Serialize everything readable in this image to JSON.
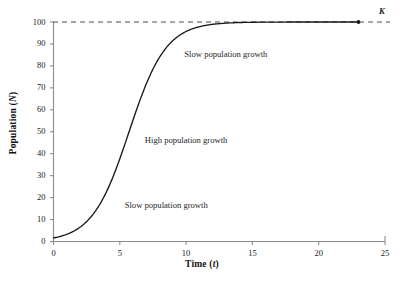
{
  "chart_data": {
    "type": "line",
    "title": "",
    "xlabel": "Time (t)",
    "ylabel": "Population (N)",
    "xlabel_text": "Time",
    "xlabel_symbol": "t",
    "ylabel_text": "Population",
    "ylabel_symbol": "N",
    "xlim": [
      0,
      25
    ],
    "ylim": [
      0,
      100
    ],
    "xticks": [
      0,
      5,
      10,
      15,
      20,
      25
    ],
    "yticks": [
      0,
      10,
      20,
      30,
      40,
      50,
      60,
      70,
      80,
      90,
      100
    ],
    "xtick_labels": [
      "0",
      "5",
      "10",
      "15",
      "20",
      "25"
    ],
    "ytick_labels": [
      "0",
      "10",
      "20",
      "30",
      "40",
      "50",
      "60",
      "70",
      "80",
      "90",
      "100"
    ],
    "grid": false,
    "legend": false,
    "series": [
      {
        "name": "Logistic population growth",
        "style": "solid",
        "color": "#1a1a1a",
        "end_marker": "dot",
        "model": "logistic",
        "carrying_capacity": 100,
        "growth_rate": 0.72,
        "inflection_t": 5.7,
        "x": [
          0,
          1,
          2,
          3,
          4,
          5,
          5.7,
          6,
          7,
          8,
          9,
          10,
          11,
          12,
          13,
          14,
          15,
          16,
          17,
          18,
          19,
          20,
          21,
          22,
          23
        ],
        "y": [
          1.7,
          3.4,
          6.8,
          13.1,
          23.7,
          39.0,
          50.0,
          55.5,
          70.6,
          82.2,
          89.9,
          94.5,
          97.1,
          98.5,
          99.2,
          99.6,
          99.8,
          99.9,
          99.9,
          100.0,
          100.0,
          100.0,
          100.0,
          100.0,
          100.0
        ]
      }
    ],
    "reference_lines": [
      {
        "name": "carrying-capacity",
        "orientation": "horizontal",
        "value": 100,
        "style": "dashed",
        "label": "K",
        "label_italic": true
      }
    ],
    "annotations": [
      {
        "text": "Slow population growth",
        "x": 13.0,
        "y": 85.0
      },
      {
        "text": "High population growth",
        "x": 10.0,
        "y": 46.0
      },
      {
        "text": "Slow population growth",
        "x": 8.5,
        "y": 16.0
      }
    ],
    "colors": {
      "curve": "#1a1a1a",
      "axis": "#8c8c8c",
      "dashed": "#4d4d4d",
      "text": "#1a1a1a",
      "background": "#ffffff"
    }
  }
}
